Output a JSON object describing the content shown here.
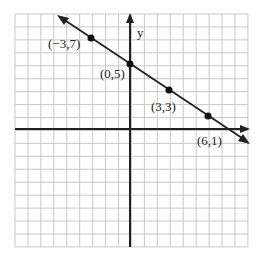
{
  "chart_data": {
    "type": "line",
    "title": "",
    "xlabel": "",
    "ylabel": "y",
    "grid": true,
    "xlim": [
      -9,
      9
    ],
    "ylim": [
      -9,
      9
    ],
    "series": [
      {
        "name": "line through points",
        "equation": "y = -2/3 x + 5",
        "points": [
          {
            "x": -3,
            "y": 7,
            "label": "(−3,7)"
          },
          {
            "x": 0,
            "y": 5,
            "label": "(0,5)"
          },
          {
            "x": 3,
            "y": 3,
            "label": "(3,3)"
          },
          {
            "x": 6,
            "y": 1,
            "label": "(6,1)"
          }
        ]
      }
    ]
  },
  "labels": {
    "y_axis": "y",
    "p1": "(−3,7)",
    "p2": "(0,5)",
    "p3": "(3,3)",
    "p4": "(6,1)"
  },
  "colors": {
    "grid": "#c8c8c8",
    "axis": "#222222",
    "line": "#222222"
  }
}
